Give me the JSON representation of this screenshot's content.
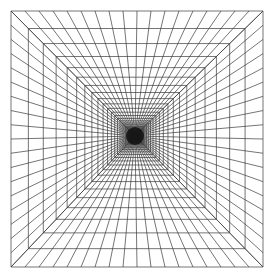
{
  "figure": {
    "title": "Perspective tunnel grid illusion",
    "canvas": {
      "width": 268,
      "height": 276,
      "background": "#ffffff"
    },
    "line_color": "#3a3a3a",
    "line_width": 0.7,
    "outer_square": {
      "x1": 11,
      "y1": 11,
      "x2": 263,
      "y2": 267
    },
    "vanishing_point": {
      "x": 135,
      "y": 136
    },
    "radial_divisions_per_edge": 18,
    "concentric_squares": 26,
    "perspective_ratio": 0.86,
    "center_blob": {
      "radius": 9,
      "color": "#111111"
    }
  }
}
